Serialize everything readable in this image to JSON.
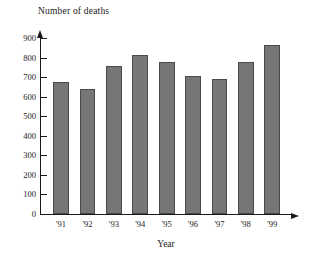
{
  "chart_data": {
    "type": "bar",
    "title": "Number of deaths",
    "xlabel": "Year",
    "ylabel": "",
    "categories": [
      "'91",
      "'92",
      "'93",
      "'94",
      "'95",
      "'96",
      "'97",
      "'98",
      "'99"
    ],
    "values": [
      675,
      640,
      755,
      815,
      775,
      705,
      692,
      778,
      865
    ],
    "ylim": [
      0,
      900
    ],
    "ytick_labels": [
      "900",
      "800",
      "700",
      "600",
      "500",
      "400",
      "300",
      "200",
      "100",
      "0"
    ],
    "ytick_values": [
      900,
      800,
      700,
      600,
      500,
      400,
      300,
      200,
      100,
      0
    ],
    "ytick_step": 100,
    "grid": false,
    "legend": null,
    "bar_color": "#767676",
    "bar_outline_color": "#4a4a4a",
    "axis_color": "#1a1a1a",
    "background_color": "#ffffff",
    "y_axis_arrow": true,
    "x_axis_arrow": true
  }
}
